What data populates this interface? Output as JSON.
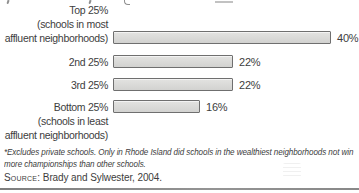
{
  "chart": {
    "rows": [
      {
        "label_lines": [
          "Top 25%",
          "(schools in most",
          "affluent neighborhoods)"
        ],
        "value": 40,
        "value_label": "40%"
      },
      {
        "label_lines": [
          "2nd 25%"
        ],
        "value": 22,
        "value_label": "22%"
      },
      {
        "label_lines": [
          "3rd 25%"
        ],
        "value": 22,
        "value_label": "22%"
      },
      {
        "label_lines": [
          "Bottom 25%",
          "(schools in least",
          "affluent neighborhoods)"
        ],
        "value": 16,
        "value_label": "16%"
      }
    ]
  },
  "chart_data": {
    "type": "bar",
    "orientation": "horizontal",
    "title": "",
    "xlabel": "",
    "ylabel": "",
    "categories": [
      "Top 25% (schools in most affluent neighborhoods)",
      "2nd 25%",
      "3rd 25%",
      "Bottom 25% (schools in least affluent neighborhoods)"
    ],
    "values": [
      40,
      22,
      22,
      16
    ],
    "value_labels": [
      "40%",
      "22%",
      "22%",
      "16%"
    ],
    "xlim": [
      0,
      42
    ],
    "grid": false,
    "legend": "none"
  },
  "footnote": {
    "line1": "*Excludes private schools. Only in Rhode Island did schools in the wealthiest neighborhoods not win",
    "line2": "more championships than other schools."
  },
  "source": {
    "label": "Source:",
    "text": " Brady and Sylwester, 2004."
  },
  "colors": {
    "text": "#3d3d3d",
    "bar_fill_light": "#e3e3e1",
    "bar_fill_dark": "#d2d2d0",
    "bar_border": "#6f6f6f",
    "rule": "#8a8a8a"
  }
}
